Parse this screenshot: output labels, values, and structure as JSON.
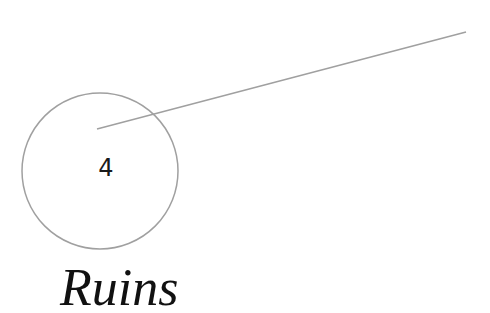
{
  "marker": {
    "number": "4"
  },
  "title": "Ruins",
  "colors": {
    "stroke": "#a0a0a0",
    "text": "#111111"
  }
}
